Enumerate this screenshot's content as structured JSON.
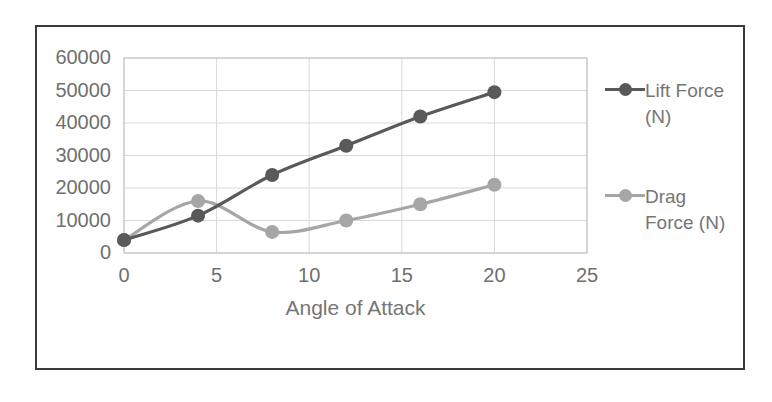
{
  "chart_data": {
    "type": "line",
    "title": "",
    "xlabel": "Angle of Attack",
    "ylabel": "",
    "x": [
      0,
      4,
      8,
      12,
      16,
      20
    ],
    "series": [
      {
        "name": "Lift Force (N)",
        "values": [
          4000,
          11500,
          24000,
          33000,
          42000,
          49500
        ],
        "color": "#595959"
      },
      {
        "name": "Drag Force (N)",
        "values": [
          4000,
          16000,
          6500,
          10000,
          15000,
          21000
        ],
        "color": "#a6a6a6"
      }
    ],
    "xlim": [
      0,
      25
    ],
    "ylim": [
      0,
      60000
    ],
    "xticks": [
      "0",
      "5",
      "10",
      "15",
      "20",
      "25"
    ],
    "yticks": [
      "0",
      "10000",
      "20000",
      "30000",
      "40000",
      "50000",
      "60000"
    ],
    "grid": "horizontal-and-vertical",
    "legend_position": "right",
    "smoothed": true
  },
  "legend": {
    "entries": [
      {
        "label": "Lift Force (N)"
      },
      {
        "label": "Drag Force (N)"
      }
    ]
  },
  "axis": {
    "x_title": "Angle of Attack"
  },
  "colors": {
    "lift": "#595959",
    "drag": "#a6a6a6",
    "gridline": "#d9d9d9",
    "plot_border": "#bfbfbf",
    "tick_text": "#6f6f6f",
    "page_frame": "#3a3a3a"
  }
}
